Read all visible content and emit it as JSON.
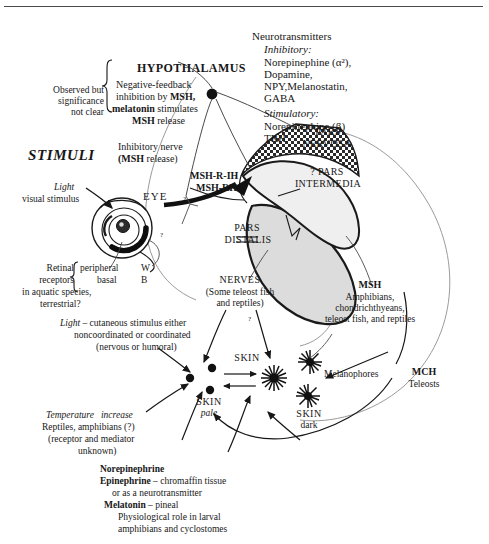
{
  "figure": {
    "title_hypothalamus": "HYPOTHALAMUS",
    "stimuli_header": "STIMULI"
  },
  "neurotransmitters": {
    "heading": "Neurotransmitters",
    "inhibitory_label": "Inhibitory:",
    "inhibitory_lines": [
      "Norepinephine (α²),",
      "Dopamine,",
      "NPY,Melanostatin,",
      "GABA"
    ],
    "stimulatory_label": "Stimulatory:",
    "stimulatory_lines": [
      "Norepinephine (β)",
      "TRH"
    ]
  },
  "feedback_note": {
    "left_lines": [
      "Observed but",
      "significance",
      "not clear"
    ],
    "right_line1_pre": "Negative-feedback",
    "right_line2_pre": "inhibition by ",
    "right_line2_bold": "MSH,",
    "right_line3_bold": "melatonin",
    "right_line3_post": " stimulates",
    "right_line4_bold": "MSH",
    "right_line4_post": " release"
  },
  "inhibitory_nerve": {
    "line1": "Inhibitory nerve",
    "line2_bold": "(MSH",
    "line2_post": " release)"
  },
  "releasing_hormones": {
    "line1": "MSH-R-IH",
    "line1_q": "?",
    "line2": "MSH-RH"
  },
  "pituitary": {
    "pars_nervosa": [
      "PARS",
      "NERVOSA"
    ],
    "pars_intermedia": [
      "? PARS",
      "INTERMEDIA"
    ],
    "pars_distalis": [
      "PARS",
      "DISTALIS"
    ]
  },
  "eye": {
    "label": "EYE",
    "light_italic": "Light",
    "stimulus_line": "visual stimulus",
    "retinal_bracket": [
      "Retinal",
      "receptors"
    ],
    "receptor_rows": [
      {
        "name": "peripheral",
        "code": "W"
      },
      {
        "name": "basal",
        "code": "B"
      }
    ],
    "species_lines": [
      "in aquatic species,",
      "terrestrial?"
    ],
    "question_mark": "?"
  },
  "cutaneous": {
    "light_italic": "Light",
    "line1_post": " – cutaneous stimulus either",
    "line2": "noncoordinated or coordinated",
    "line3": "(nervous or humoral)"
  },
  "nerves": {
    "heading": "NERVES",
    "line1": "(Some teleost fish",
    "line2": "and reptiles)",
    "question_mark": "?"
  },
  "msh_targets": {
    "heading": "MSH",
    "lines": [
      "Amphibians,",
      "chondrichthyeans,",
      "teleost fish, and reptiles"
    ]
  },
  "mch": {
    "heading": "MCH",
    "line": "Teleosts"
  },
  "melanophores_label": "Melanophores",
  "skin": {
    "top_label": "SKIN",
    "pale_line1": "SKIN",
    "pale_line2_italic": "pale",
    "dark_line1": "SKIN",
    "dark_line2": "dark"
  },
  "temperature": {
    "italic_line": "Temperature   increase",
    "line2": "Reptiles, amphibians (?)",
    "line3": "(receptor and mediator",
    "line4": "unknown)"
  },
  "footnote": {
    "l1_bold": "Norepinephrine",
    "l2_bold": "Epinephrine",
    "l2_post": " – chromaffin tissue",
    "l3": "or as a neurotransmitter",
    "l4_bold": "Melatonin",
    "l4_post": " – pineal",
    "l5": "Physiological role in larval",
    "l6": "amphibians and cyclostomes"
  },
  "colors": {
    "ink": "#171717",
    "rule": "#4a4a4a",
    "pars_distalis_fill": "#d9d9d9",
    "outline": "#8a8a8a"
  }
}
